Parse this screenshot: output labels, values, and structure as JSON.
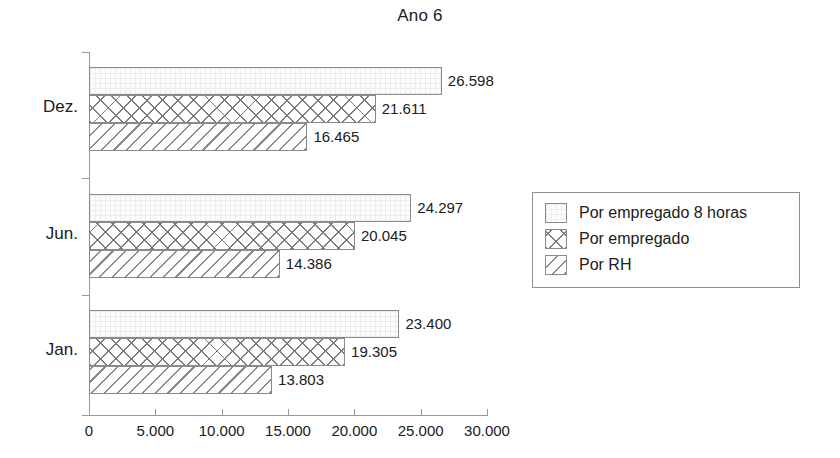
{
  "chart_data": {
    "type": "bar",
    "orientation": "horizontal",
    "title": "Ano 6",
    "xlabel": "",
    "ylabel": "",
    "categories": [
      "Jan.",
      "Jun.",
      "Dez."
    ],
    "category_order_top_to_bottom": [
      "Dez.",
      "Jun.",
      "Jan."
    ],
    "series": [
      {
        "name": "Por empregado 8 horas",
        "pattern": "fine-grid",
        "values": [
          23400,
          20045,
          26598
        ],
        "labels_by_category": {
          "Jan.": "23.400",
          "Jun.": "24.297",
          "Dez.": "26.598"
        },
        "values_by_category": {
          "Jan.": 23400,
          "Jun.": 24297,
          "Dez.": 26598
        }
      },
      {
        "name": "Por empregado",
        "pattern": "cross-hatch",
        "labels_by_category": {
          "Jan.": "19.305",
          "Jun.": "20.045",
          "Dez.": "21.611"
        },
        "values_by_category": {
          "Jan.": 19305,
          "Jun.": 20045,
          "Dez.": 21611
        }
      },
      {
        "name": "Por RH",
        "pattern": "diagonal-hatch",
        "labels_by_category": {
          "Jan.": "13.803",
          "Jun.": "14.386",
          "Dez.": "16.465"
        },
        "values_by_category": {
          "Jan.": 13803,
          "Jun.": 14386,
          "Dez.": 16465
        }
      }
    ],
    "xlim": [
      0,
      30000
    ],
    "xticks": [
      0,
      5000,
      10000,
      15000,
      20000,
      25000,
      30000
    ],
    "xtick_labels": [
      "0",
      "5.000",
      "10.000",
      "15.000",
      "20.000",
      "25.000",
      "30.000"
    ],
    "grid": false,
    "legend_position": "right",
    "legend_entries": [
      "Por empregado 8 horas",
      "Por empregado",
      "Por RH"
    ],
    "colors": {
      "axis": "#9a9a9a",
      "bar_border": "#8a8a8a",
      "text": "#202020",
      "background": "#ffffff"
    }
  },
  "groups": [
    {
      "label": "Dez.",
      "bars": [
        {
          "value": 26598,
          "label": "26.598",
          "series": "Por empregado 8 horas"
        },
        {
          "value": 21611,
          "label": "21.611",
          "series": "Por empregado"
        },
        {
          "value": 16465,
          "label": "16.465",
          "series": "Por RH"
        }
      ]
    },
    {
      "label": "Jun.",
      "bars": [
        {
          "value": 24297,
          "label": "24.297",
          "series": "Por empregado 8 horas"
        },
        {
          "value": 20045,
          "label": "20.045",
          "series": "Por empregado"
        },
        {
          "value": 14386,
          "label": "14.386",
          "series": "Por RH"
        }
      ]
    },
    {
      "label": "Jan.",
      "bars": [
        {
          "value": 23400,
          "label": "23.400",
          "series": "Por empregado 8 horas"
        },
        {
          "value": 19305,
          "label": "19.305",
          "series": "Por empregado"
        },
        {
          "value": 13803,
          "label": "13.803",
          "series": "Por RH"
        }
      ]
    }
  ]
}
